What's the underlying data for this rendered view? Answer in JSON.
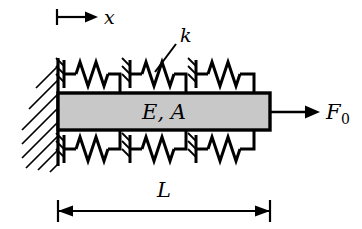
{
  "figure": {
    "type": "mechanical-schematic"
  },
  "labels": {
    "axis_x": "x",
    "spring_stiffness": "k",
    "bar_properties": "E, A",
    "force": "F",
    "force_subscript": "0",
    "length": "L"
  },
  "colors": {
    "stroke": "#000000",
    "bar_fill": "#c8c8c8",
    "background": "#ffffff",
    "hatch": "#000000"
  },
  "geometry": {
    "wall_x": 58,
    "wall_top": 58,
    "wall_bottom": 166,
    "bar_left": 58,
    "bar_right": 270,
    "bar_top": 93,
    "bar_bottom": 130,
    "spring_count_top": 3,
    "spring_count_bottom": 3,
    "dimension_line_y": 211,
    "force_arrow_tip_x": 318,
    "axis_arrow_y": 17
  },
  "elements": {
    "wall": "fixed-support-wall",
    "bar": "elastic-bar",
    "springs_top": [
      "spring-top-1",
      "spring-top-2",
      "spring-top-3"
    ],
    "springs_bottom": [
      "spring-bottom-1",
      "spring-bottom-2",
      "spring-bottom-3"
    ],
    "force_arrow": "applied-force-arrow",
    "dimension": "length-dimension",
    "axis": "x-axis-indicator",
    "leader": "stiffness-leader-line"
  }
}
